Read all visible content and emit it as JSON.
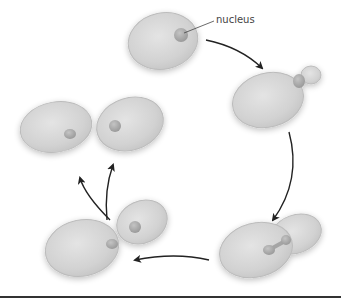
{
  "diagram": {
    "labels": {
      "nucleus": "nucleus"
    },
    "stages": [
      {
        "id": "mother-cell",
        "description": "Single yeast cell with nucleus"
      },
      {
        "id": "bud-forming",
        "description": "Bud emerges from cell"
      },
      {
        "id": "nucleus-dividing",
        "description": "Nucleus stretches into bud"
      },
      {
        "id": "bud-separating",
        "description": "Bud with nucleus pinching off"
      },
      {
        "id": "daughter-cells",
        "description": "Two separate cells"
      }
    ],
    "colors": {
      "cell_fill": "#d4d4d4",
      "cell_edge": "#bdbdbd",
      "nucleus_fill": "#a8a8a8",
      "arrow": "#222222",
      "baseline": "#333333"
    }
  }
}
